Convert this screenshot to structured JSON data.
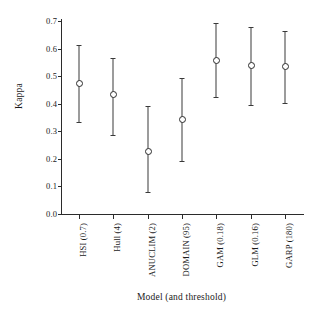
{
  "chart_data": {
    "type": "scatter",
    "title": "",
    "xlabel": "Model (and threshold)",
    "ylabel": "Kappa",
    "ylim": [
      0.0,
      0.7
    ],
    "yticks": [
      "0.0",
      "0.1",
      "0.2",
      "0.3",
      "0.4",
      "0.5",
      "0.6",
      "0.7"
    ],
    "ytick_values": [
      0.0,
      0.1,
      0.2,
      0.3,
      0.4,
      0.5,
      0.6,
      0.7
    ],
    "grid": false,
    "legend": "none",
    "error_bars": true,
    "categories": [
      "HSI (0.7)",
      "Hull (4)",
      "ANUCLIM (2)",
      "DOMAIN (95)",
      "GAM (0.18)",
      "GLM (0.16)",
      "GARP (180)"
    ],
    "values": [
      0.475,
      0.435,
      0.228,
      0.343,
      0.557,
      0.542,
      0.535
    ],
    "err_low": [
      0.335,
      0.288,
      0.08,
      0.192,
      0.424,
      0.396,
      0.403
    ],
    "err_high": [
      0.612,
      0.565,
      0.39,
      0.494,
      0.693,
      0.68,
      0.665
    ],
    "points": [
      {
        "label": "HSI (0.7)",
        "value": 0.475,
        "low": 0.335,
        "high": 0.612
      },
      {
        "label": "Hull (4)",
        "value": 0.435,
        "low": 0.288,
        "high": 0.565
      },
      {
        "label": "ANUCLIM (2)",
        "value": 0.228,
        "low": 0.08,
        "high": 0.39
      },
      {
        "label": "DOMAIN (95)",
        "value": 0.343,
        "low": 0.192,
        "high": 0.494
      },
      {
        "label": "GAM (0.18)",
        "value": 0.557,
        "low": 0.424,
        "high": 0.693
      },
      {
        "label": "GLM (0.16)",
        "value": 0.542,
        "low": 0.396,
        "high": 0.68
      },
      {
        "label": "GARP (180)",
        "value": 0.535,
        "low": 0.403,
        "high": 0.665
      }
    ],
    "colors": {
      "marker": "#2b2b2b",
      "errorbar": "#3a3a3a",
      "axis": "#2b2b2b",
      "background": "#ffffff"
    }
  }
}
